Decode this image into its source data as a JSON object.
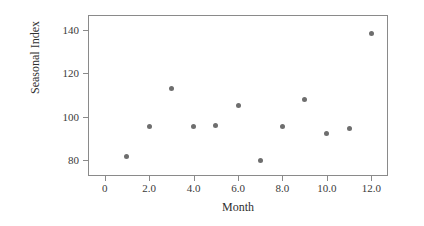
{
  "chart_data": {
    "type": "scatter",
    "title": "",
    "xlabel": "Month",
    "ylabel": "Seasonal Index",
    "x": [
      1,
      2,
      3,
      4,
      5,
      6,
      7,
      8,
      9,
      10,
      11,
      12
    ],
    "values": [
      81.6,
      95.5,
      113.0,
      95.5,
      96.0,
      105.0,
      79.5,
      95.5,
      108.0,
      92.3,
      94.7,
      138.5
    ],
    "xlim": [
      -0.75,
      12.75
    ],
    "ylim": [
      72.5,
      147.0
    ],
    "xticks": [
      0,
      2,
      4,
      6,
      8,
      10,
      12
    ],
    "xtick_labels": [
      "0",
      "2.0",
      "4.0",
      "6.0",
      "8.0",
      "10.0",
      "12.0"
    ],
    "yticks": [
      80,
      100,
      120,
      140
    ],
    "ytick_labels": [
      "80",
      "100",
      "120",
      "140"
    ],
    "grid": false,
    "legend": null,
    "marker_color": "#6e6e6e",
    "axis_color": "#8a8a8a",
    "background_color": "#ffffff"
  }
}
